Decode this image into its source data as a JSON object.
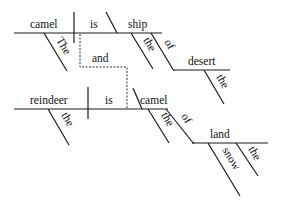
{
  "diagram": {
    "type": "sentence-diagram",
    "clause1": {
      "subject": "camel",
      "verb": "is",
      "complement": "ship",
      "subject_modifier": "The",
      "complement_modifier": "the",
      "preposition": "of",
      "prep_object": "desert",
      "prep_object_modifier": "the"
    },
    "conjunction": "and",
    "clause2": {
      "subject": "reindeer",
      "verb": "is",
      "complement": "camel",
      "subject_modifier": "the",
      "complement_modifier": "the",
      "preposition": "of",
      "prep_object": "land",
      "prep_object_modifiers": [
        "snow",
        "the"
      ]
    }
  }
}
